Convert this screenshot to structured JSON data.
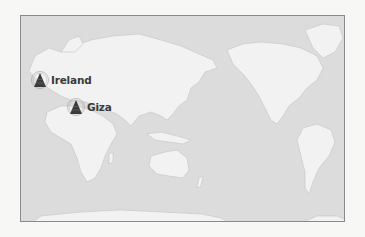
{
  "map": {
    "projection": "Pacific-centered world map",
    "colors": {
      "ocean": "#dcdcdc",
      "land": "#f2f2f2",
      "frame": "#8a8a8a",
      "marker": "#3b3b3b",
      "label": "#3a3a3a"
    },
    "markers": [
      {
        "id": "ireland",
        "label": "Ireland",
        "icon": "pyramid-icon"
      },
      {
        "id": "giza",
        "label": "Giza",
        "icon": "pyramid-icon"
      }
    ]
  }
}
